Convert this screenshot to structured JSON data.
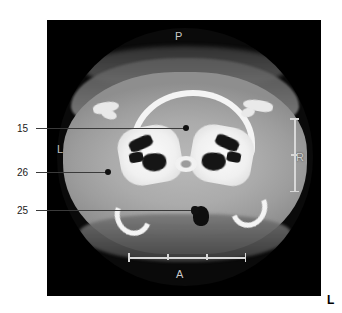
{
  "figure": {
    "modality": "CT",
    "plane": "axial",
    "panel": {
      "background_color": "#000000"
    }
  },
  "orientation_markers": [
    {
      "id": "posterior",
      "label": "P",
      "position": "top-center",
      "color": "#c9c9c9"
    },
    {
      "id": "anterior",
      "label": "A",
      "position": "bottom-center",
      "color": "#c9c9c9"
    },
    {
      "id": "left-inner",
      "label": "L",
      "position": "left-inside-scan",
      "color": "#c2c2c2"
    },
    {
      "id": "right",
      "label": "R",
      "position": "right-inside-scan",
      "color": "#d0d0d0"
    },
    {
      "id": "left-outer",
      "label": "L",
      "position": "bottom-right-outside-panel",
      "color": "#000000"
    }
  ],
  "scale_bars": [
    {
      "id": "horizontal",
      "orientation": "horizontal",
      "segments": 3,
      "color": "#d8d8d8"
    },
    {
      "id": "vertical",
      "orientation": "vertical",
      "segments": 2,
      "color": "#d8d8d8"
    }
  ],
  "callouts": [
    {
      "id": "callout-15",
      "label": "15"
    },
    {
      "id": "callout-26",
      "label": "26"
    },
    {
      "id": "callout-25",
      "label": "25"
    }
  ]
}
